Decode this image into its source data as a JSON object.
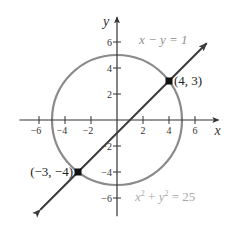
{
  "diagram": {
    "axes": {
      "x_label": "x",
      "y_label": "y",
      "x_range": [
        -7.5,
        7.8
      ],
      "y_range": [
        -7.4,
        7.9
      ],
      "x_ticks": [
        -6,
        -4,
        -2,
        2,
        4,
        6
      ],
      "y_ticks": [
        -6,
        -4,
        -2,
        2,
        4,
        6
      ],
      "x_tick_labels": [
        "−6",
        "−4",
        "−2",
        "2",
        "4",
        "6"
      ],
      "y_tick_labels": [
        "−6",
        "−4",
        "−2",
        "2",
        "4",
        "6"
      ]
    },
    "circle": {
      "equation_label": "x² + y² = 25",
      "eq_parts": {
        "x": "x",
        "exp1": "2",
        "plus": " + ",
        "y": "y",
        "exp2": "2",
        "rest": " = 25"
      },
      "center": [
        0,
        0
      ],
      "radius": 5,
      "color": "#8a8a8a",
      "label_color": "#a8a8a8"
    },
    "line": {
      "equation_label": "x − y = 1",
      "slope": 1,
      "intercept": -1,
      "x_start": -5.9,
      "x_end": 6.9,
      "color": "#3c3c3c",
      "label_color": "#8f8f8f"
    },
    "points": [
      {
        "x": 4,
        "y": 3,
        "label": "(4, 3)"
      },
      {
        "x": -3,
        "y": -4,
        "label": "(−3, −4)"
      }
    ],
    "axis_color": "#333333"
  }
}
